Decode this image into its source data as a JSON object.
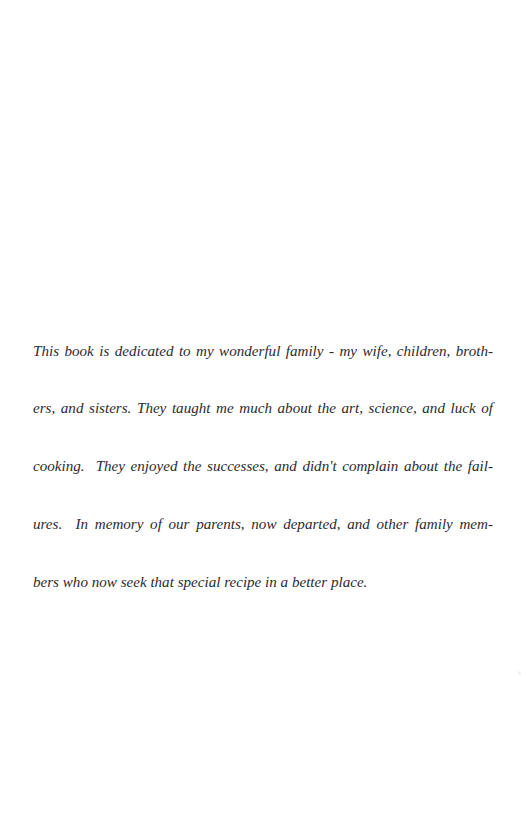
{
  "page": {
    "kind": "book-dedication-page",
    "background_color": "#ffffff",
    "text_color": "#2b2b31",
    "width_px": 526,
    "height_px": 837
  },
  "dedication": {
    "full_text": "This book is dedicated to my wonderful family - my wife, children, brothers, and sisters. They taught me much about the art, science, and luck of cooking.  They enjoyed the successes, and didn't complain about the failures.  In memory of our parents, now departed, and other family members who now seek that special recipe in a better place.",
    "lines": [
      "This book is dedicated to my wonderful family - my wife, children, broth-",
      "ers, and sisters. They taught me much about the art, science, and luck of",
      "cooking.  They enjoyed the successes, and didn't complain about the fail-",
      "ures.  In memory of our parents, now departed, and other family mem-",
      "bers who now seek that special recipe in a better place."
    ]
  }
}
